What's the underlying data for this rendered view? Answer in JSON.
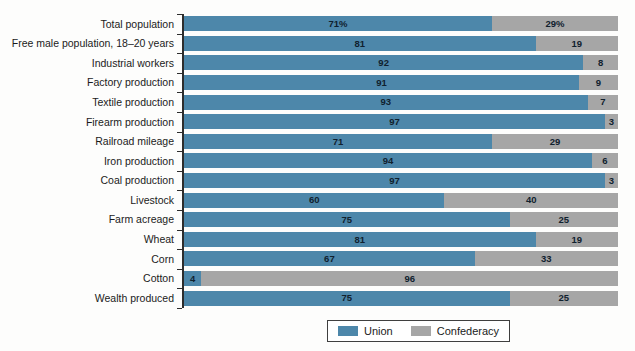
{
  "chart_data": {
    "type": "bar",
    "orientation": "horizontal-stacked",
    "unit": "percent",
    "xlim": [
      0,
      100
    ],
    "grid": false,
    "legend_position": "bottom-center",
    "categories": [
      "Total population",
      "Free male population, 18–20 years",
      "Industrial workers",
      "Factory production",
      "Textile production",
      "Firearm production",
      "Railroad mileage",
      "Iron production",
      "Coal production",
      "Livestock",
      "Farm acreage",
      "Wheat",
      "Corn",
      "Cotton",
      "Wealth produced"
    ],
    "series": [
      {
        "name": "Union",
        "color": "#4d87aa",
        "values": [
          71,
          81,
          92,
          91,
          93,
          97,
          71,
          94,
          97,
          60,
          75,
          81,
          67,
          4,
          75
        ],
        "labels": [
          "71%",
          "81",
          "92",
          "91",
          "93",
          "97",
          "71",
          "94",
          "97",
          "60",
          "75",
          "81",
          "67",
          "4",
          "75"
        ]
      },
      {
        "name": "Confederacy",
        "color": "#a6a6a6",
        "values": [
          29,
          19,
          8,
          9,
          7,
          3,
          29,
          6,
          3,
          40,
          25,
          19,
          33,
          96,
          25
        ],
        "labels": [
          "29%",
          "19",
          "8",
          "9",
          "7",
          "3",
          "29",
          "6",
          "3",
          "40",
          "25",
          "19",
          "33",
          "96",
          "25"
        ]
      }
    ]
  },
  "legend": {
    "items": [
      {
        "label": "Union",
        "color": "#4d87aa"
      },
      {
        "label": "Confederacy",
        "color": "#a6a6a6"
      }
    ]
  }
}
